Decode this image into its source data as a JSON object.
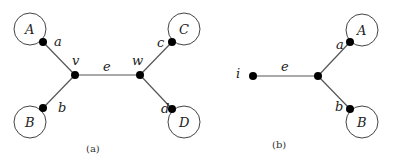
{
  "figure_a": {
    "caption": "(a)",
    "edge_label": "e",
    "vertices": [
      {
        "id": "v",
        "label": "v",
        "x": 75,
        "y": 75
      },
      {
        "id": "w",
        "label": "w",
        "x": 140,
        "y": 75
      }
    ],
    "subtrees": [
      {
        "name": "A",
        "port": "a",
        "cx": 30,
        "cy": 29,
        "px": 43,
        "py": 42
      },
      {
        "name": "B",
        "port": "b",
        "cx": 30,
        "cy": 122,
        "px": 43,
        "py": 108
      },
      {
        "name": "C",
        "port": "c",
        "cx": 184,
        "cy": 29,
        "px": 172,
        "py": 42
      },
      {
        "name": "D",
        "port": "d",
        "cx": 184,
        "cy": 122,
        "px": 172,
        "py": 109
      }
    ]
  },
  "figure_b": {
    "caption": "(b)",
    "edge_label": "e",
    "leaf_label": "i",
    "leaf": {
      "x": 253,
      "y": 76
    },
    "junction": {
      "x": 318,
      "y": 76
    },
    "subtrees": [
      {
        "name": "A",
        "port": "a",
        "cx": 362,
        "cy": 30,
        "px": 350,
        "py": 42
      },
      {
        "name": "B",
        "port": "b",
        "cx": 362,
        "cy": 122,
        "px": 350,
        "py": 109
      }
    ]
  }
}
